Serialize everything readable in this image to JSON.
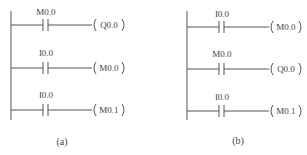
{
  "diagrams": [
    {
      "caption": "(a)",
      "rungs": [
        {
          "contact": "M0.0",
          "coil": "Q0.0"
        },
        {
          "contact": "I0.0",
          "coil": "M0.0"
        },
        {
          "contact": "I0.0",
          "coil": "M0.1"
        }
      ]
    },
    {
      "caption": "(b)",
      "rungs": [
        {
          "contact": "I0.0",
          "coil": "M0.0"
        },
        {
          "contact": "M0.0",
          "coil": "Q0.0"
        },
        {
          "contact": "I0.0",
          "coil": "M0.1"
        }
      ]
    }
  ]
}
